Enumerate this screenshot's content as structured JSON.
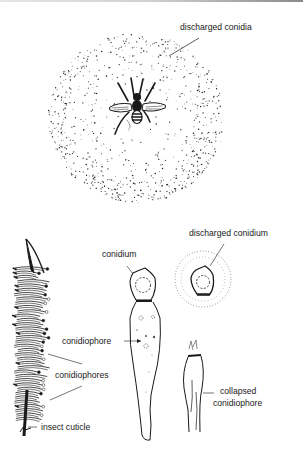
{
  "figure": {
    "panel_top": {
      "subject": "infected fly with halo of discharged conidia",
      "labels": {
        "discharged_conidia": "discharged conidia"
      }
    },
    "panel_bottom": {
      "labels": {
        "conidium": "conidium",
        "discharged_conidium": "discharged conidium",
        "conidiophore": "conidiophore",
        "conidiophores": "conidiophores",
        "collapsed_line1": "collapsed",
        "collapsed_line2": "conidiophore",
        "insect_cuticle": "insect cuticle"
      }
    }
  },
  "colors": {
    "ink": "#1a1a1a",
    "background": "#ffffff"
  }
}
